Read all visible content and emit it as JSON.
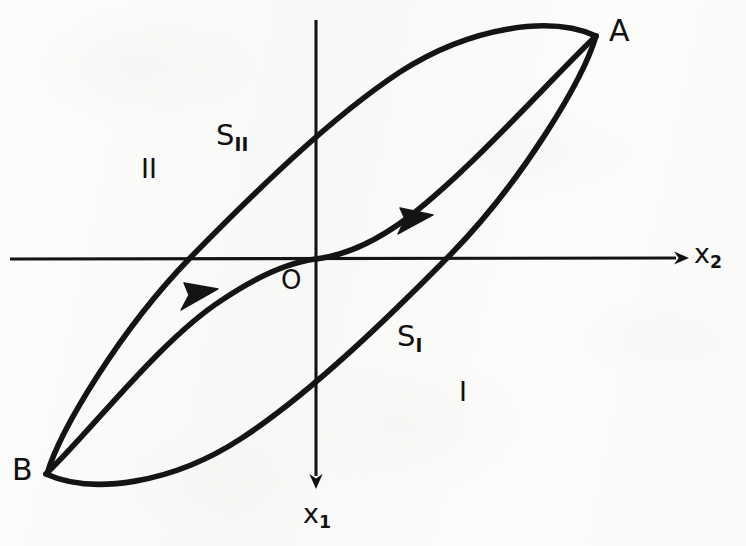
{
  "figure": {
    "kind": "hysteresis-phase-portrait",
    "background_color": "#fbfbfa",
    "ink_color": "#111111"
  },
  "axes": {
    "horizontal": {
      "name": "x2-axis",
      "label": "x",
      "label_subscript": "2",
      "direction": "right",
      "arrowhead": true
    },
    "vertical": {
      "name": "x1-axis",
      "label": "x",
      "label_subscript": "1",
      "direction": "down",
      "arrowhead": true
    },
    "origin_label": "O"
  },
  "points": [
    {
      "id": "A",
      "label": "A",
      "x": 595,
      "y": 35
    },
    {
      "id": "B",
      "label": "B",
      "x": 45,
      "y": 473
    }
  ],
  "regions": [
    {
      "id": "I",
      "label": "I",
      "x": 465,
      "y": 395
    },
    {
      "id": "II",
      "label": "II",
      "x": 150,
      "y": 172
    }
  ],
  "switching_curves": [
    {
      "id": "S_I",
      "label": "S",
      "subscript": "I",
      "x": 400,
      "y": 342
    },
    {
      "id": "S_II",
      "label": "S",
      "subscript": "II",
      "x": 222,
      "y": 140
    }
  ],
  "flow_arrows": [
    {
      "id": "arrow-upper",
      "direction": "up-right",
      "x": 418,
      "y": 227
    },
    {
      "id": "arrow-lower",
      "direction": "up-right",
      "x": 200,
      "y": 300
    }
  ],
  "curves": {
    "s_curve": "S-shaped switching locus through origin from B to A",
    "outer_loop": "closed hysteresis loop joining A and B"
  }
}
